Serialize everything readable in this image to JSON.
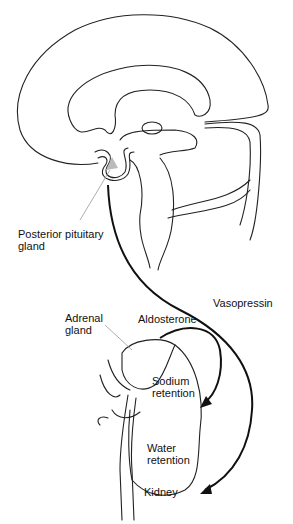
{
  "diagram": {
    "type": "anatomical-flow",
    "labels": {
      "posterior_pituitary": "Posterior pituitary\ngland",
      "vasopressin": "Vasopressin",
      "adrenal_gland": "Adrenal\ngland",
      "aldosterone": "Aldosterone",
      "sodium_retention": "Sodium\nretention",
      "water_retention": "Water\nretention",
      "kidney": "Kidney"
    },
    "colors": {
      "line": "#222222",
      "arrow": "#111111",
      "pituitary_fill": "#bbbbbb",
      "leader": "#999999"
    },
    "flows": [
      {
        "from": "Posterior pituitary gland",
        "to": "Water retention",
        "via": "Vasopressin"
      },
      {
        "from": "Adrenal gland",
        "to": "Sodium retention",
        "via": "Aldosterone"
      }
    ]
  }
}
